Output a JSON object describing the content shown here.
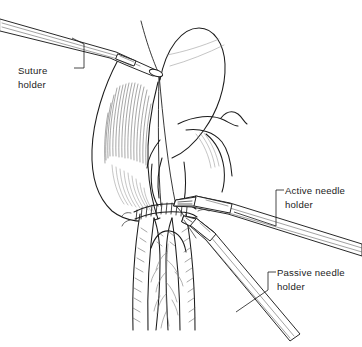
{
  "figure": {
    "background_color": "#ffffff",
    "ink_color": "#1c1c1c",
    "width": 362,
    "height": 347,
    "style": "black-and-white line drawing"
  },
  "labels": [
    {
      "id": "suture-holder",
      "line1": "Suture",
      "line2": "holder",
      "text_x": 18,
      "text_y": 74,
      "align": "start"
    },
    {
      "id": "active-needle-holder",
      "line1": "Active needle",
      "line2": "holder",
      "text_x": 285,
      "text_y": 194,
      "align": "start"
    },
    {
      "id": "passive-needle-holder",
      "line1": "Passive needle",
      "line2": "holder",
      "text_x": 277,
      "text_y": 276,
      "align": "start"
    }
  ],
  "anatomy": {
    "left_lobe_label": "hatched tissue lobe",
    "upper_flap_label": "retracted tissue flap",
    "lower_conduit_label": "tubular conduit with vessels",
    "anastomosis_label": "running suture line",
    "stitch_count": 11
  },
  "instruments": [
    {
      "id": "suture-holder-instrument",
      "name": "suture holder",
      "orientation": "upper-left to center"
    },
    {
      "id": "active-needle-holder-instrument",
      "name": "active needle holder",
      "orientation": "center to right"
    },
    {
      "id": "passive-needle-holder-instrument",
      "name": "passive needle holder",
      "orientation": "center to lower-right"
    }
  ]
}
